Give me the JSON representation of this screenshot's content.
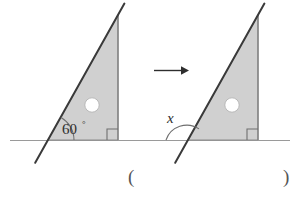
{
  "figure": {
    "type": "geometry-diagram",
    "colors": {
      "triangle_fill": "#d0d0d0",
      "triangle_stroke": "#8d8d8d",
      "hypotenuse_stroke": "#3a3a3a",
      "baseline_stroke": "#9a9a9a",
      "arc_stroke": "#6f6f6f",
      "arrow_stroke": "#2e2e2e",
      "hole_fill": "#ffffff",
      "text": "#2e2e2e",
      "paren": "#555555",
      "background": "#ffffff"
    },
    "left_shape": {
      "name": "left-triangle",
      "angle_label": "60",
      "degree_symbol": "°",
      "angle_value": 60,
      "has_hole": true,
      "has_right_angle_mark": true
    },
    "right_shape": {
      "name": "right-triangle",
      "angle_label": "x",
      "angle_value": null,
      "has_hole": true,
      "has_right_angle_mark": true
    },
    "arrow": {
      "name": "translation-arrow",
      "direction": "right"
    },
    "answer_blank": {
      "open_paren": "(",
      "close_paren": ")",
      "value": ""
    }
  }
}
